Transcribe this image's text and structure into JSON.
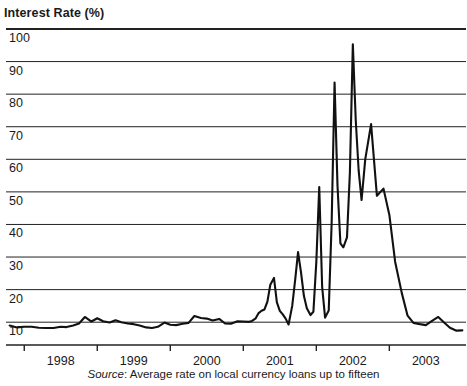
{
  "chart_data": {
    "type": "line",
    "title": "Interest Rate (%)",
    "xlabel": "",
    "ylabel": "Interest Rate (%)",
    "ylim": [
      3,
      100
    ],
    "xlim": [
      1997.25,
      2003.55
    ],
    "grid": true,
    "legend": null,
    "yticks": [
      10,
      20,
      30,
      40,
      50,
      60,
      70,
      80,
      90,
      100
    ],
    "ytick_labels": [
      "10",
      "20",
      "30",
      "40",
      "50",
      "60",
      "70",
      "80",
      "90",
      "100"
    ],
    "xticks": [
      1998,
      1999,
      2000,
      2001,
      2002,
      2003
    ],
    "xtick_labels": [
      "1998",
      "1999",
      "2000",
      "2001",
      "2002",
      "2003"
    ],
    "series": [
      {
        "name": "Interest Rate",
        "color": "#111111",
        "x": [
          1997.3,
          1997.4,
          1997.5,
          1997.6,
          1997.7,
          1997.8,
          1997.9,
          1998.0,
          1998.08,
          1998.17,
          1998.25,
          1998.33,
          1998.42,
          1998.5,
          1998.58,
          1998.67,
          1998.75,
          1998.83,
          1998.92,
          1999.0,
          1999.08,
          1999.17,
          1999.25,
          1999.33,
          1999.42,
          1999.5,
          1999.58,
          1999.67,
          1999.75,
          1999.83,
          1999.92,
          2000.0,
          2000.08,
          2000.17,
          2000.25,
          2000.33,
          2000.42,
          2000.5,
          2000.58,
          2000.62,
          2000.67,
          2000.71,
          2000.75,
          2000.79,
          2000.83,
          2000.87,
          2000.92,
          2000.96,
          2001.0,
          2001.04,
          2001.08,
          2001.12,
          2001.17,
          2001.21,
          2001.25,
          2001.29,
          2001.33,
          2001.37,
          2001.42,
          2001.46,
          2001.5,
          2001.54,
          2001.58,
          2001.62,
          2001.67,
          2001.71,
          2001.75,
          2001.79,
          2001.83,
          2001.87,
          2001.92,
          2001.96,
          2002.0,
          2002.04,
          2002.08,
          2002.12,
          2002.17,
          2002.25,
          2002.33,
          2002.42,
          2002.5,
          2002.58,
          2002.67,
          2002.75,
          2002.83,
          2002.92,
          2003.0,
          2003.08,
          2003.17,
          2003.25,
          2003.33,
          2003.42,
          2003.5
        ],
        "y": [
          9.0,
          8.4,
          8.6,
          8.6,
          8.3,
          8.2,
          8.2,
          8.6,
          8.5,
          9.0,
          9.6,
          11.6,
          10.2,
          11.2,
          10.3,
          9.9,
          10.6,
          10.0,
          9.6,
          9.4,
          9.0,
          8.4,
          8.2,
          8.6,
          9.9,
          9.2,
          9.1,
          9.5,
          9.8,
          11.9,
          11.3,
          11.1,
          10.5,
          11.0,
          9.6,
          9.5,
          10.3,
          10.2,
          10.1,
          10.4,
          11.2,
          12.8,
          13.5,
          13.9,
          16.3,
          21.5,
          23.6,
          16.1,
          13.5,
          12.4,
          11.1,
          9.3,
          15.0,
          22.9,
          31.5,
          25.4,
          18.1,
          14.3,
          12.2,
          13.2,
          28.5,
          51.5,
          20.8,
          11.4,
          13.6,
          40.5,
          83.6,
          52.0,
          34.2,
          33.0,
          36.0,
          56.0,
          95.3,
          72.0,
          56.5,
          47.5,
          60.0,
          70.8,
          48.8,
          51.0,
          43.0,
          28.5,
          19.0,
          12.0,
          9.8,
          9.4,
          9.1,
          10.3,
          11.6,
          9.9,
          8.3,
          7.4,
          7.5
        ]
      }
    ],
    "annotations": []
  },
  "axes": {
    "title": "Interest Rate (%)",
    "y_axis_labels": [
      "100",
      "90",
      "80",
      "70",
      "60",
      "50",
      "40",
      "30",
      "20",
      "10"
    ],
    "x_axis_labels": [
      "1998",
      "1999",
      "2000",
      "2001",
      "2002",
      "2003"
    ]
  },
  "source": {
    "label": "Source",
    "separator": ": ",
    "text": "Average rate on local currency loans up to fifteen"
  },
  "style": {
    "line_color": "#111111",
    "grid_color": "#222222",
    "background": "#ffffff",
    "text_color": "#1a1a1a"
  }
}
